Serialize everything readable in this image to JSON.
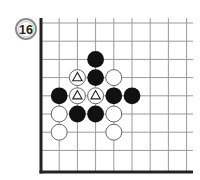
{
  "problem": {
    "number": "16"
  },
  "board": {
    "origin_x": 41,
    "origin_y": 23,
    "spacing": 18.2,
    "cols": 9,
    "rows": 8,
    "right_edge": 193,
    "bottom_edge": 172,
    "line_color": "#9a9a9a",
    "border_color": "#222222"
  },
  "stones": [
    {
      "color": "black",
      "col": 3,
      "row": 2,
      "mark": ""
    },
    {
      "color": "white",
      "col": 2,
      "row": 3,
      "mark": "triangle"
    },
    {
      "color": "black",
      "col": 3,
      "row": 3,
      "mark": ""
    },
    {
      "color": "white",
      "col": 4,
      "row": 3,
      "mark": ""
    },
    {
      "color": "black",
      "col": 1,
      "row": 4,
      "mark": ""
    },
    {
      "color": "white",
      "col": 2,
      "row": 4,
      "mark": "triangle"
    },
    {
      "color": "white",
      "col": 3,
      "row": 4,
      "mark": "triangle"
    },
    {
      "color": "black",
      "col": 4,
      "row": 4,
      "mark": ""
    },
    {
      "color": "black",
      "col": 5,
      "row": 4,
      "mark": ""
    },
    {
      "color": "white",
      "col": 1,
      "row": 5,
      "mark": ""
    },
    {
      "color": "black",
      "col": 2,
      "row": 5,
      "mark": ""
    },
    {
      "color": "black",
      "col": 3,
      "row": 5,
      "mark": ""
    },
    {
      "color": "white",
      "col": 4,
      "row": 5,
      "mark": ""
    },
    {
      "color": "white",
      "col": 1,
      "row": 6,
      "mark": ""
    },
    {
      "color": "white",
      "col": 4,
      "row": 6,
      "mark": ""
    }
  ]
}
